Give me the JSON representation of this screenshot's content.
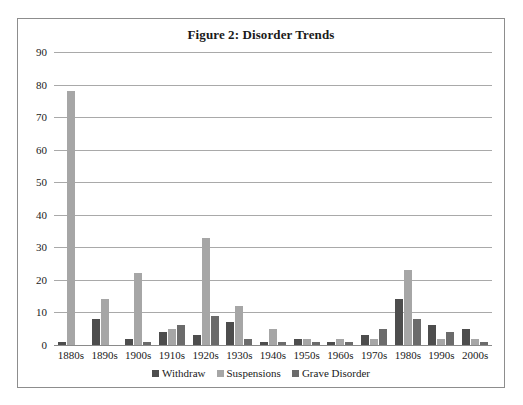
{
  "figure": {
    "title": "Figure 2: Disorder Trends"
  },
  "chart_data": {
    "type": "bar",
    "title": "Figure 2: Disorder Trends",
    "xlabel": "",
    "ylabel": "",
    "ylim": [
      0,
      90
    ],
    "yticks": [
      0,
      10,
      20,
      30,
      40,
      50,
      60,
      70,
      80,
      90
    ],
    "grid": true,
    "legend_position": "bottom",
    "categories": [
      "1880s",
      "1890s",
      "1900s",
      "1910s",
      "1920s",
      "1930s",
      "1940s",
      "1950s",
      "1960s",
      "1970s",
      "1980s",
      "1990s",
      "2000s"
    ],
    "series": [
      {
        "name": "Withdraw",
        "color": "#4d4d4d",
        "values": [
          1,
          8,
          2,
          4,
          3,
          7,
          1,
          2,
          1,
          3,
          14,
          6,
          5
        ]
      },
      {
        "name": "Suspensions",
        "color": "#a6a6a6",
        "values": [
          78,
          14,
          22,
          5,
          33,
          12,
          5,
          2,
          2,
          2,
          23,
          2,
          2
        ]
      },
      {
        "name": "Grave Disorder",
        "color": "#6b6b6b",
        "values": [
          0,
          0,
          1,
          6,
          9,
          2,
          1,
          1,
          1,
          5,
          8,
          4,
          1
        ]
      }
    ]
  }
}
